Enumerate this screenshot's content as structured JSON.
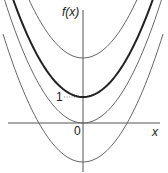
{
  "chart_data": {
    "type": "line",
    "title": "",
    "xlabel": "x",
    "ylabel": "f(x)",
    "annotations": [
      {
        "text": "1",
        "at": [
          0,
          1
        ],
        "note": "dotted guide from y-axis label to vertex of bold curve"
      },
      {
        "text": "0",
        "at": [
          0,
          0
        ],
        "note": "origin"
      }
    ],
    "grid": false,
    "legend": null,
    "xlim": [
      -2.9,
      2.9
    ],
    "ylim": [
      -1.9,
      4.3
    ],
    "series": [
      {
        "name": "f(x) = x^2 + 2.5",
        "style": "thin",
        "vertex": [
          0,
          2.5
        ]
      },
      {
        "name": "f(x) = x^2 + 1",
        "style": "bold",
        "vertex": [
          0,
          1
        ]
      },
      {
        "name": "f(x) = x^2",
        "style": "thin",
        "vertex": [
          0,
          0
        ]
      },
      {
        "name": "f(x) = x^2 - 1.5",
        "style": "thin",
        "vertex": [
          0,
          -1.5
        ]
      }
    ]
  },
  "labels": {
    "y_axis": "f(x)",
    "x_axis": "x",
    "origin": "0",
    "one": "1"
  }
}
